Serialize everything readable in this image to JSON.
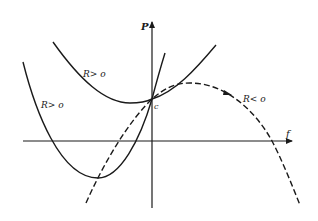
{
  "diagram": {
    "type": "phase-plot",
    "axes": {
      "vertical": {
        "label": "P"
      },
      "horizontal": {
        "label": "f"
      }
    },
    "point": {
      "label": "c"
    },
    "curves": [
      {
        "id": "upper-parabola",
        "label": "R> o",
        "style": "solid"
      },
      {
        "id": "steep-parabola",
        "label": "R> o",
        "style": "solid"
      },
      {
        "id": "dashed-curve",
        "label": "R< o",
        "style": "dashed",
        "has_direction_arrow": true
      }
    ]
  }
}
